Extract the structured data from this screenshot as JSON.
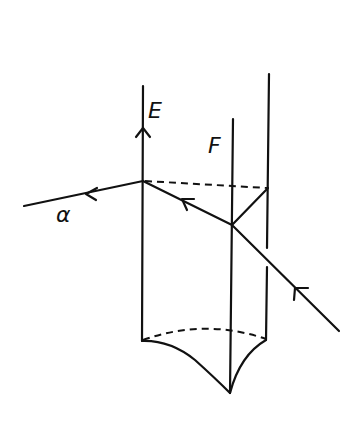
{
  "diagram": {
    "type": "optics-ray-diagram",
    "labels": {
      "E": "E",
      "F": "F",
      "alpha": "α"
    },
    "colors": {
      "stroke": "#111111",
      "background": "#ffffff"
    }
  }
}
